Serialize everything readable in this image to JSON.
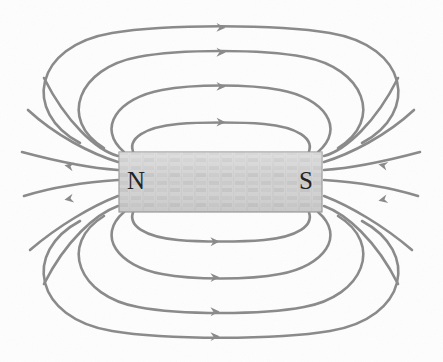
{
  "figure": {
    "kind": "physics-diagram",
    "width": 443,
    "height": 362,
    "background_color": "#fdfdfd"
  },
  "magnet": {
    "label_north": "N",
    "label_south": "S",
    "x": 119,
    "y": 152,
    "width": 203,
    "height": 60,
    "fill_color": "#d2d2d2",
    "border_color": "#9a9a9a",
    "texture": "fine-hatched-grain"
  },
  "field": {
    "line_color": "#8a8a8a",
    "line_width": 2.6,
    "arrow_color": "#8a8a8a",
    "direction_note": "lines exit the N pole, loop around, and enter the S pole",
    "loop_count_top": 3,
    "loop_count_bottom": 3,
    "fan_count_each_side": 5,
    "arrow_icon": "arrowhead-icon"
  },
  "geometry": {
    "center_x": 220.5,
    "center_y": 182,
    "top_arcs": [
      {
        "id": "top-arc-1",
        "peak_y": 127,
        "half_width": 80,
        "arrow_x": 224
      },
      {
        "id": "top-arc-2",
        "peak_y": 97,
        "half_width": 125,
        "arrow_x": 224
      },
      {
        "id": "top-arc-3",
        "peak_y": 65,
        "half_width": 163,
        "arrow_x": 224
      },
      {
        "id": "top-arc-4",
        "peak_y": 33,
        "half_width": 196,
        "arrow_x": 224
      }
    ],
    "bottom_arcs": [
      {
        "id": "bottom-arc-1",
        "peak_y": 237,
        "half_width": 80,
        "arrow_x": 218
      },
      {
        "id": "bottom-arc-2",
        "peak_y": 267,
        "half_width": 125,
        "arrow_x": 218
      },
      {
        "id": "bottom-arc-3",
        "peak_y": 299,
        "half_width": 163,
        "arrow_x": 218
      },
      {
        "id": "bottom-arc-4",
        "peak_y": 328,
        "half_width": 196,
        "arrow_x": 218
      }
    ],
    "left_fan_angles_deg": [
      -62,
      -34,
      -8,
      12,
      38,
      64
    ],
    "right_fan_angles_deg": [
      -62,
      -34,
      -8,
      12,
      38,
      64
    ],
    "left_arrows": [
      {
        "id": "left-arrow-upper",
        "x": 72,
        "y": 175,
        "angle_deg": 192
      },
      {
        "id": "left-arrow-lower",
        "x": 72,
        "y": 199,
        "angle_deg": 168
      }
    ],
    "right_arrows": [
      {
        "id": "right-arrow-upper",
        "x": 372,
        "y": 173,
        "angle_deg": 188
      },
      {
        "id": "right-arrow-lower",
        "x": 372,
        "y": 201,
        "angle_deg": 172
      }
    ]
  }
}
